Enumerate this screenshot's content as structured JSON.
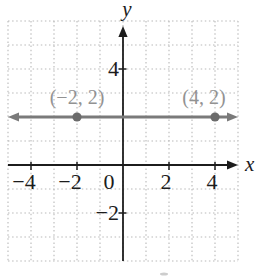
{
  "figure": {
    "background": "#ffffff",
    "grid_color": "#b9b9b9",
    "axis_color": "#1c1c1c",
    "tick_label_color": "#1c1c1c",
    "line_color": "#7a7a7a",
    "point_color": "#6b6b6b",
    "point_label_color": "#929292",
    "artifact_color": "#cdcdcd"
  },
  "chart_data": {
    "type": "line",
    "title": "",
    "xlabel": "x",
    "ylabel": "y",
    "xlim": [
      -5,
      5
    ],
    "ylim": [
      -4,
      6
    ],
    "grid": true,
    "grid_style": "dotted",
    "x_tick_labels": [
      {
        "value": -4,
        "label": "−4"
      },
      {
        "value": -2,
        "label": "−2"
      },
      {
        "value": 0,
        "label": "0"
      },
      {
        "value": 2,
        "label": "2"
      },
      {
        "value": 4,
        "label": "4"
      }
    ],
    "y_tick_labels": [
      {
        "value": 4,
        "label": "4"
      },
      {
        "value": -2,
        "label": "−2"
      }
    ],
    "series": [
      {
        "name": "horizontal-line",
        "equation": "y = 2",
        "x": [
          -5,
          5
        ],
        "y": [
          2,
          2
        ],
        "arrow_both_ends": true
      }
    ],
    "points": [
      {
        "x": -2,
        "y": 2,
        "label": "(−2, 2)",
        "label_dx": 0
      },
      {
        "x": 4,
        "y": 2,
        "label": "(4, 2)",
        "label_dx": -11
      }
    ]
  }
}
